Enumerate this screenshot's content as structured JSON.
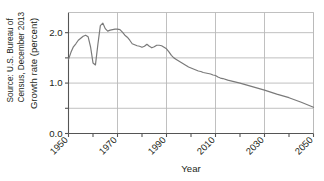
{
  "source_note": "Source: U.S. Bureau of Census, December 2013",
  "chart_data": {
    "type": "line",
    "title": "",
    "xlabel": "Year",
    "ylabel": "Growth rate (percent)",
    "xlim": [
      1950,
      2050
    ],
    "ylim": [
      0.0,
      2.4
    ],
    "grid": true,
    "legend": "none",
    "line_color": "#7a7a7a",
    "axis_color": "#555555",
    "grid_color": "#b9b9b9",
    "y_ticks": [
      0.0,
      0.5,
      1.0,
      1.5,
      2.0
    ],
    "y_tick_labels": [
      "0.0",
      "",
      "1.0",
      "",
      "2.0"
    ],
    "x_ticks": [
      1950,
      1960,
      1970,
      1980,
      1990,
      2000,
      2010,
      2020,
      2030,
      2040,
      2050
    ],
    "x_tick_labels": [
      "1950",
      "",
      "1970",
      "",
      "1990",
      "",
      "2010",
      "",
      "2030",
      "",
      "2050"
    ],
    "series": [
      {
        "name": "World population growth rate",
        "x": [
          1950,
          1951,
          1952,
          1953,
          1954,
          1955,
          1956,
          1957,
          1958,
          1959,
          1960,
          1961,
          1962,
          1963,
          1964,
          1965,
          1966,
          1967,
          1968,
          1969,
          1970,
          1971,
          1972,
          1973,
          1974,
          1975,
          1976,
          1977,
          1978,
          1979,
          1980,
          1981,
          1982,
          1983,
          1984,
          1985,
          1986,
          1987,
          1988,
          1989,
          1990,
          1991,
          1992,
          1993,
          1994,
          1995,
          1996,
          1997,
          1998,
          1999,
          2000,
          2001,
          2002,
          2003,
          2004,
          2005,
          2006,
          2007,
          2008,
          2009,
          2010,
          2011,
          2012,
          2013,
          2015,
          2020,
          2025,
          2030,
          2035,
          2040,
          2045,
          2050
        ],
        "values": [
          1.47,
          1.61,
          1.72,
          1.78,
          1.85,
          1.89,
          1.93,
          1.95,
          1.92,
          1.72,
          1.4,
          1.36,
          1.77,
          2.14,
          2.19,
          2.08,
          2.03,
          2.05,
          2.06,
          2.07,
          2.07,
          2.06,
          2.01,
          1.95,
          1.91,
          1.85,
          1.78,
          1.76,
          1.74,
          1.73,
          1.71,
          1.73,
          1.77,
          1.73,
          1.7,
          1.72,
          1.75,
          1.75,
          1.74,
          1.71,
          1.68,
          1.62,
          1.55,
          1.5,
          1.47,
          1.44,
          1.41,
          1.38,
          1.35,
          1.32,
          1.3,
          1.28,
          1.26,
          1.24,
          1.23,
          1.21,
          1.2,
          1.19,
          1.18,
          1.16,
          1.15,
          1.12,
          1.1,
          1.09,
          1.06,
          1.0,
          0.93,
          0.86,
          0.78,
          0.71,
          0.62,
          0.52
        ]
      }
    ],
    "annotations": []
  }
}
